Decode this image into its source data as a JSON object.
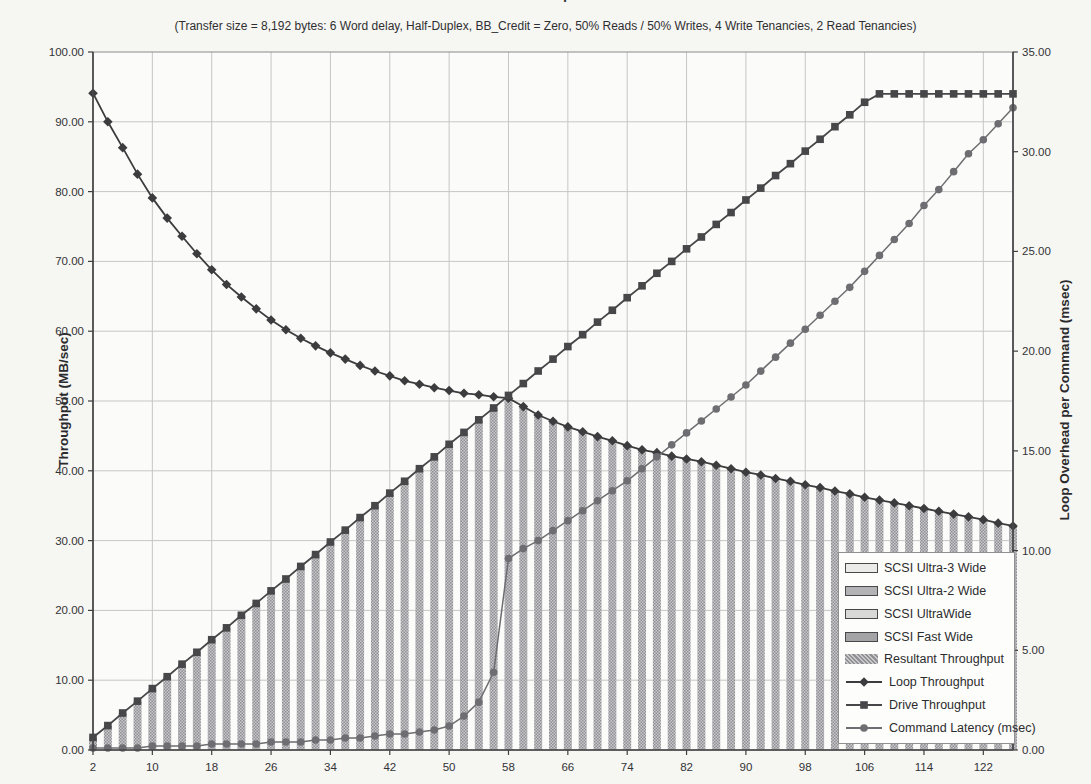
{
  "title": "Fibre Channel Arbitrated Loop Performance Estimate",
  "subtitle": "(Transfer size = 8,192 bytes: 6 Word delay, Half-Duplex, BB_Credit = Zero, 50% Reads / 50% Writes, 4 Write Tenancies, 2 Read Tenancies)",
  "chart_data": {
    "type": "bar",
    "subtype": "combo bar + line, dual y-axis",
    "grid": true,
    "legend_position": "inside bottom-right",
    "x_range": [
      2,
      126
    ],
    "x_step": 2,
    "x": [
      2,
      4,
      6,
      8,
      10,
      12,
      14,
      16,
      18,
      20,
      22,
      24,
      26,
      28,
      30,
      32,
      34,
      36,
      38,
      40,
      42,
      44,
      46,
      48,
      50,
      52,
      54,
      56,
      58,
      60,
      62,
      64,
      66,
      68,
      70,
      72,
      74,
      76,
      78,
      80,
      82,
      84,
      86,
      88,
      90,
      92,
      94,
      96,
      98,
      100,
      102,
      104,
      106,
      108,
      110,
      112,
      114,
      116,
      118,
      120,
      122,
      124,
      126
    ],
    "x_tick_labels": [
      "2",
      "10",
      "18",
      "26",
      "34",
      "42",
      "50",
      "58",
      "66",
      "74",
      "82",
      "90",
      "98",
      "106",
      "114",
      "122"
    ],
    "xlabel": "",
    "y_left": {
      "label": "Throughput (MB/sec)",
      "min": 0,
      "max": 100,
      "step": 10,
      "tick_format": "0.00"
    },
    "y_right": {
      "label": "Loop Overhead per Command (msec)",
      "min": 0,
      "max": 35,
      "step": 5,
      "tick_format": "0.00"
    },
    "series": [
      {
        "name": "Resultant Throughput",
        "type": "bar",
        "axis": "left",
        "pattern": "gray-checker",
        "values": [
          1.8,
          3.5,
          5.3,
          7.0,
          8.8,
          10.5,
          12.3,
          14.0,
          15.8,
          17.5,
          19.3,
          21.0,
          22.8,
          24.5,
          26.3,
          28.0,
          29.8,
          31.5,
          33.3,
          35.0,
          36.8,
          38.5,
          40.3,
          42.0,
          43.8,
          45.5,
          47.3,
          49.0,
          50.4,
          49.2,
          48.0,
          47.1,
          46.3,
          45.6,
          44.9,
          44.3,
          43.6,
          43.0,
          42.6,
          42.1,
          41.7,
          41.3,
          40.8,
          40.3,
          39.8,
          39.4,
          38.9,
          38.5,
          38.0,
          37.6,
          37.1,
          36.7,
          36.2,
          35.8,
          35.4,
          35.0,
          34.6,
          34.2,
          33.8,
          33.4,
          33.0,
          32.5,
          32.1
        ]
      },
      {
        "name": "Loop Throughput",
        "type": "line",
        "marker": "diamond",
        "axis": "left",
        "color": "#3c3c3e",
        "values": [
          94.1,
          90.0,
          86.3,
          82.5,
          79.1,
          76.2,
          73.6,
          71.1,
          68.8,
          66.7,
          64.9,
          63.2,
          61.6,
          60.2,
          59.0,
          57.9,
          56.9,
          56.0,
          55.1,
          54.3,
          53.6,
          52.9,
          52.4,
          51.9,
          51.5,
          51.1,
          50.9,
          50.6,
          50.4,
          49.2,
          48.0,
          47.1,
          46.3,
          45.6,
          44.9,
          44.3,
          43.6,
          43.0,
          42.6,
          42.1,
          41.7,
          41.3,
          40.8,
          40.3,
          39.8,
          39.4,
          38.9,
          38.5,
          38.0,
          37.6,
          37.1,
          36.7,
          36.2,
          35.8,
          35.4,
          35.0,
          34.6,
          34.2,
          33.8,
          33.4,
          33.0,
          32.5,
          32.1
        ]
      },
      {
        "name": "Drive Throughput",
        "type": "line",
        "marker": "square",
        "axis": "left",
        "color": "#47474a",
        "values": [
          1.8,
          3.5,
          5.3,
          7.0,
          8.8,
          10.5,
          12.3,
          14.0,
          15.8,
          17.5,
          19.3,
          21.0,
          22.8,
          24.5,
          26.3,
          28.0,
          29.8,
          31.5,
          33.3,
          35.0,
          36.8,
          38.5,
          40.3,
          42.0,
          43.8,
          45.5,
          47.3,
          49.0,
          50.8,
          52.5,
          54.3,
          56.0,
          57.8,
          59.5,
          61.3,
          63.0,
          64.8,
          66.5,
          68.3,
          70.0,
          71.8,
          73.5,
          75.3,
          77.0,
          78.8,
          80.5,
          82.3,
          84.0,
          85.8,
          87.5,
          89.3,
          91.0,
          92.8,
          94.0,
          94.0,
          94.0,
          94.0,
          94.0,
          94.0,
          94.0,
          94.0,
          94.0,
          94.0
        ]
      },
      {
        "name": "Command Latency (msec)",
        "type": "line",
        "marker": "circle",
        "axis": "right",
        "color": "#6e6e72",
        "values": [
          0.1,
          0.1,
          0.1,
          0.1,
          0.2,
          0.2,
          0.2,
          0.2,
          0.3,
          0.3,
          0.3,
          0.3,
          0.4,
          0.4,
          0.4,
          0.5,
          0.5,
          0.6,
          0.6,
          0.7,
          0.8,
          0.8,
          0.9,
          1.0,
          1.2,
          1.7,
          2.4,
          3.9,
          9.6,
          10.1,
          10.5,
          11.0,
          11.5,
          12.0,
          12.5,
          13.0,
          13.5,
          14.1,
          14.7,
          15.3,
          15.9,
          16.5,
          17.1,
          17.7,
          18.3,
          19.0,
          19.7,
          20.4,
          21.1,
          21.8,
          22.5,
          23.2,
          24.0,
          24.8,
          25.6,
          26.4,
          27.3,
          28.1,
          29.0,
          29.9,
          30.6,
          31.4,
          32.2
        ]
      }
    ],
    "legend": [
      {
        "label": "SCSI Ultra-3 Wide",
        "swatch": "box",
        "fill": "#ebebe9"
      },
      {
        "label": "SCSI Ultra-2 Wide",
        "swatch": "box",
        "fill": "#b3b3b6"
      },
      {
        "label": "SCSI UltraWide",
        "swatch": "box",
        "fill": "#d8d8d6"
      },
      {
        "label": "SCSI Fast Wide",
        "swatch": "box",
        "fill": "#a4a4a7"
      },
      {
        "label": "Resultant Throughput",
        "swatch": "pattern"
      },
      {
        "label": "Loop Throughput",
        "swatch": "line-diamond",
        "color": "#3c3c3e"
      },
      {
        "label": "Drive Throughput",
        "swatch": "line-square",
        "color": "#47474a"
      },
      {
        "label": "Command Latency (msec)",
        "swatch": "line-circle",
        "color": "#6e6e72"
      }
    ],
    "colors": {
      "bar_fill_dark": "#909094",
      "bar_fill_light": "#c9c9cc",
      "gridline": "#c6c6c6",
      "axis": "#3f3f41",
      "plot_border": "#8a8a8a",
      "tick_text": "#333335",
      "plot_background": "#fbfbf9"
    }
  }
}
